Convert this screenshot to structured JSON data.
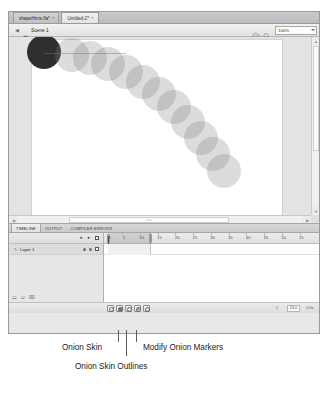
{
  "window": {
    "tabs": [
      {
        "label": "shapeHints.fla*",
        "close": "×",
        "active": false
      },
      {
        "label": "Untitled-2*",
        "close": "×",
        "active": true
      }
    ]
  },
  "edit_bar": {
    "back_arrow": "◀",
    "scene_icon": "scene-icon",
    "scene_name": "Scene 1",
    "edit_scene_icon": "edit-scene-icon",
    "edit_symbol_icon": "edit-symbol-icon",
    "zoom_value": "100%",
    "zoom_caret": "▼"
  },
  "stage": {
    "onion_frames": [
      {
        "x": 12,
        "y": 12,
        "r": 17,
        "current": true
      },
      {
        "x": 40,
        "y": 15,
        "r": 17,
        "current": false
      },
      {
        "x": 58,
        "y": 18,
        "r": 17,
        "current": false
      },
      {
        "x": 76,
        "y": 24,
        "r": 17,
        "current": false
      },
      {
        "x": 94,
        "y": 32,
        "r": 17,
        "current": false
      },
      {
        "x": 111,
        "y": 42,
        "r": 17,
        "current": false
      },
      {
        "x": 127,
        "y": 54,
        "r": 17,
        "current": false
      },
      {
        "x": 142,
        "y": 67,
        "r": 17,
        "current": false
      },
      {
        "x": 156,
        "y": 82,
        "r": 17,
        "current": false
      },
      {
        "x": 169,
        "y": 98,
        "r": 17,
        "current": false
      },
      {
        "x": 181,
        "y": 114,
        "r": 17,
        "current": false
      },
      {
        "x": 192,
        "y": 131,
        "r": 17,
        "current": false
      }
    ],
    "vscroll_up": "▲",
    "vscroll_down": "▼",
    "hscroll_left": "◀",
    "hscroll_right": "▶"
  },
  "panel_tabs": [
    {
      "label": "TIMELINE",
      "active": true
    },
    {
      "label": "OUTPUT",
      "active": false
    },
    {
      "label": "COMPILER ERRORS",
      "active": false
    }
  ],
  "timeline": {
    "layer_header": {
      "eye_icon": "●",
      "lock_icon": "●",
      "outline_icon": "outline-box-icon"
    },
    "layers": [
      {
        "name": "Layer 1",
        "pencil_icon": "✎"
      }
    ],
    "layer_tools": {
      "new_layer_icon": "▭",
      "new_folder_icon": "▱",
      "delete_icon": "⌧"
    },
    "ruler_ticks": [
      {
        "label": "1",
        "frame": 1
      },
      {
        "label": "5",
        "frame": 5
      },
      {
        "label": "10",
        "frame": 10
      },
      {
        "label": "15",
        "frame": 15
      },
      {
        "label": "20",
        "frame": 20
      },
      {
        "label": "25",
        "frame": 25
      },
      {
        "label": "30",
        "frame": 30
      },
      {
        "label": "35",
        "frame": 35
      },
      {
        "label": "40",
        "frame": 40
      },
      {
        "label": "45",
        "frame": 45
      },
      {
        "label": "50",
        "frame": 50
      },
      {
        "label": "55",
        "frame": 55
      }
    ],
    "onion_range": {
      "start_frame": 1,
      "end_frame": 12
    },
    "playhead_frame": 1,
    "status": {
      "controls": [
        {
          "name": "center-frame-button",
          "icon": "⌖"
        },
        {
          "name": "onion-skin-button",
          "icon": "onion-skin-icon"
        },
        {
          "name": "onion-skin-outlines-button",
          "icon": "onion-outlines-icon"
        },
        {
          "name": "edit-multiple-frames-button",
          "icon": "edit-multiple-icon"
        },
        {
          "name": "modify-onion-markers-button",
          "icon": "modify-markers-icon"
        }
      ],
      "current_frame": "1",
      "fps": "24.0",
      "elapsed": "0.0s"
    }
  },
  "callouts": [
    {
      "label": "Onion Skin"
    },
    {
      "label": "Modify Onion Markers"
    },
    {
      "label": "Onion Skin Outlines"
    }
  ]
}
